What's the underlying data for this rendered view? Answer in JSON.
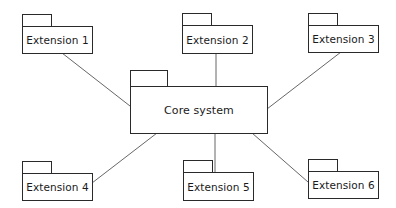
{
  "diagram": {
    "type": "package-diagram",
    "colors": {
      "stroke": "#2a2a2a",
      "connector": "#555555",
      "background": "#ffffff",
      "text": "#1a1a1a"
    },
    "core": {
      "label": "Core system"
    },
    "extensions": [
      {
        "label": "Extension 1"
      },
      {
        "label": "Extension 2"
      },
      {
        "label": "Extension 3"
      },
      {
        "label": "Extension 4"
      },
      {
        "label": "Extension 5"
      },
      {
        "label": "Extension 6"
      }
    ],
    "connections": [
      {
        "from": "Extension 1",
        "to": "Core system"
      },
      {
        "from": "Extension 2",
        "to": "Core system"
      },
      {
        "from": "Extension 3",
        "to": "Core system"
      },
      {
        "from": "Extension 4",
        "to": "Core system"
      },
      {
        "from": "Extension 5",
        "to": "Core system"
      },
      {
        "from": "Extension 6",
        "to": "Core system"
      }
    ]
  }
}
